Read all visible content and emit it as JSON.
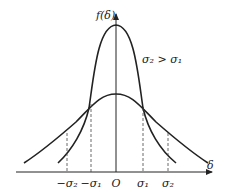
{
  "diagram": {
    "type": "normal-distribution-comparison",
    "y_axis_label": "f(δ)",
    "x_axis_label": "δ",
    "relation_label": "σ₂ > σ₁",
    "origin_label": "O",
    "ticks": [
      "−σ₂",
      "−σ₁",
      "O",
      "σ₁",
      "σ₂"
    ],
    "tick_labels": {
      "neg_sigma2": "−σ₂",
      "neg_sigma1": "−σ₁",
      "origin": "O",
      "sigma1": "σ₁",
      "sigma2": "σ₂"
    },
    "curves": [
      {
        "name": "narrow",
        "sigma": "σ₁"
      },
      {
        "name": "wide",
        "sigma": "σ₂"
      }
    ],
    "line_color": "#222222",
    "dash_color": "#444444"
  }
}
